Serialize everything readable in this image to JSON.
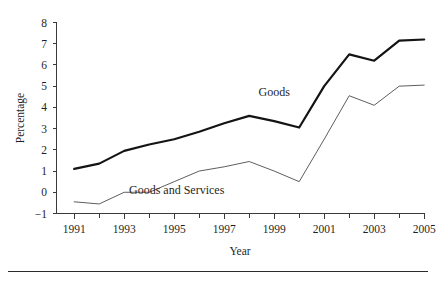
{
  "chart_data": {
    "type": "line",
    "title": "",
    "xlabel": "Year",
    "ylabel": "Percentage",
    "x": [
      1991,
      1992,
      1993,
      1994,
      1995,
      1996,
      1997,
      1998,
      1999,
      2000,
      2001,
      2002,
      2003,
      2004,
      2005
    ],
    "xlim": [
      1990.7,
      2005.4
    ],
    "ylim": [
      -1,
      8
    ],
    "yticks": [
      -1,
      0,
      1,
      2,
      3,
      4,
      5,
      6,
      7,
      8
    ],
    "ytick_labels": [
      "−1",
      "0",
      "1",
      "2",
      "3",
      "4",
      "5",
      "6",
      "7",
      "8"
    ],
    "xticks_major": [
      1991,
      1993,
      1995,
      1997,
      1999,
      2001,
      2003,
      2005
    ],
    "xtick_major_labels": [
      "1991",
      "1993",
      "1995",
      "1997",
      "1999",
      "2001",
      "2003",
      "2005"
    ],
    "xticks_minor": [
      1992,
      1994,
      1996,
      1998,
      2000,
      2002,
      2004
    ],
    "grid": false,
    "legend_position": "inline-annotation",
    "series": [
      {
        "name": "Goods",
        "style": "thick-black",
        "color": "#141414",
        "label_x": 1999.0,
        "label_y": 4.55,
        "values": [
          1.1,
          1.35,
          1.95,
          2.25,
          2.5,
          2.85,
          3.25,
          3.6,
          3.35,
          3.05,
          5.0,
          6.5,
          6.2,
          7.15,
          7.2
        ]
      },
      {
        "name": "Goods and Services",
        "style": "thin-gray",
        "color": "#4c4c4c",
        "label_x": 1995.1,
        "label_y": -0.07,
        "values": [
          -0.45,
          -0.55,
          0.0,
          0.0,
          0.5,
          1.0,
          1.2,
          1.45,
          1.0,
          0.5,
          2.5,
          4.55,
          4.1,
          5.0,
          5.05
        ]
      }
    ],
    "annotations": [
      {
        "text": "Goods",
        "x": 1999.0,
        "y": 4.55
      },
      {
        "text": "Goods and Services",
        "x": 1995.1,
        "y": -0.07
      }
    ]
  },
  "footer": {
    "rule": true
  }
}
